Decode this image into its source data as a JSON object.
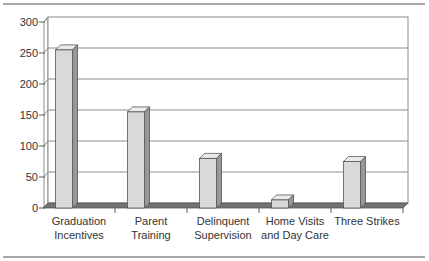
{
  "chart_data": {
    "type": "bar",
    "style": "3d-column",
    "title": "",
    "xlabel": "",
    "ylabel": "",
    "categories": [
      "Graduation Incentives",
      "Parent Training",
      "Delinquent Supervision",
      "Home Visits and Day Care",
      "Three Strikes"
    ],
    "category_label_lines": [
      [
        "Graduation",
        "Incentives"
      ],
      [
        "Parent",
        "Training"
      ],
      [
        "Delinquent",
        "Supervision"
      ],
      [
        "Home Visits",
        "and Day Care"
      ],
      [
        "Three Strikes"
      ]
    ],
    "values": [
      255,
      155,
      80,
      13,
      75
    ],
    "ylim": [
      0,
      300
    ],
    "yticks": [
      0,
      50,
      100,
      150,
      200,
      250,
      300
    ],
    "grid": true,
    "legend": false
  },
  "colors": {
    "bar_front": "#d9d9d9",
    "bar_top": "#ebebeb",
    "bar_side": "#989898",
    "bar_outline": "#4d4d4d",
    "floor": "#737373",
    "wall": "#ffffff",
    "gridline": "#8c8c8c",
    "axis": "#595959",
    "text": "#333333",
    "rule": "#a8a8a8"
  }
}
